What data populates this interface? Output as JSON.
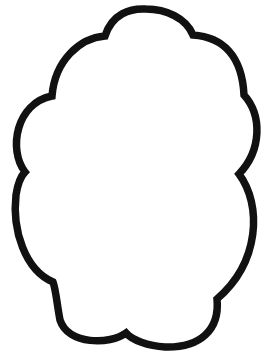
{
  "figure": {
    "shape": "cloud-outline",
    "stroke_color": "#111111",
    "fill_color": "#ffffff",
    "background": "#ffffff"
  }
}
